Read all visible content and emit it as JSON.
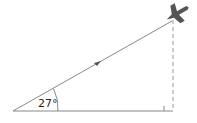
{
  "diagram": {
    "type": "right-triangle-elevation",
    "angle_label": "27°",
    "angle_degrees": 27,
    "icons": {
      "plane": "airplane-icon",
      "direction_marker": "arrowhead-icon",
      "right_angle": "right-angle-marker"
    },
    "colors": {
      "line": "#888888",
      "dashed": "#aaaaaa",
      "plane": "#555555",
      "text": "#222222"
    }
  }
}
